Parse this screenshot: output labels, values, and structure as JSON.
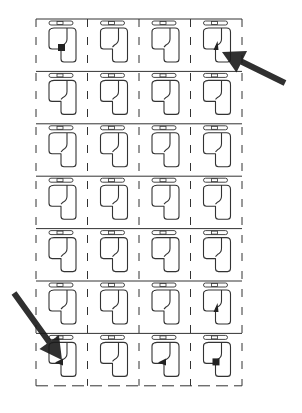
{
  "diagram": {
    "title": "",
    "grid": {
      "columns": 4,
      "rows": 7,
      "left": 36,
      "top": 19,
      "cell_width": 51.5,
      "cell_height": 52.4
    },
    "colors": {
      "line": "#333333",
      "marker": "#222222",
      "arrow": "#1a1a1a",
      "background": "#ffffff"
    },
    "markers": [
      {
        "row": 0,
        "col": 0,
        "shape": "square"
      },
      {
        "row": 0,
        "col": 3,
        "shape": "triangle-up"
      },
      {
        "row": 5,
        "col": 3,
        "shape": "triangle-up"
      },
      {
        "row": 6,
        "col": 0,
        "shape": "triangle-left"
      },
      {
        "row": 6,
        "col": 2,
        "shape": "triangle-left"
      },
      {
        "row": 6,
        "col": 3,
        "shape": "square"
      }
    ],
    "arrows": [
      {
        "name": "arrow-top-right",
        "from": [
          285,
          83
        ],
        "to": [
          222,
          52
        ]
      },
      {
        "name": "arrow-bottom-left",
        "from": [
          14,
          293
        ],
        "to": [
          62,
          360
        ]
      }
    ]
  }
}
